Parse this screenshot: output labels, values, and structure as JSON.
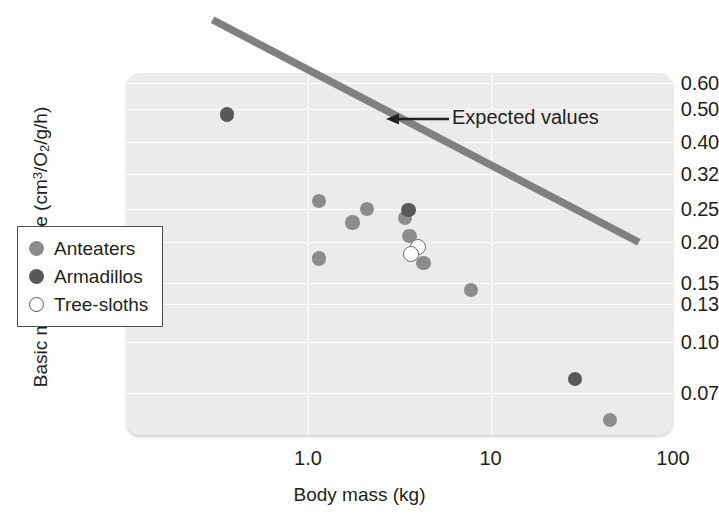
{
  "chart_data": {
    "type": "scatter",
    "title": "",
    "xlabel": "Body mass (kg)",
    "ylabel_text": "Basic metabolic rate (cm3/O2/g/h)",
    "ylabel_parts": {
      "pre": "Basic metabolic rate (cm",
      "sup": "3",
      "mid": "/O",
      "sub": "2",
      "post": "/g/h)"
    },
    "xscale": "log",
    "yscale": "log",
    "xlim": [
      0.3,
      100
    ],
    "ylim": [
      0.055,
      0.72
    ],
    "xticks": [
      "1.0",
      "10",
      "100"
    ],
    "xtick_values": [
      1.0,
      10,
      100
    ],
    "yticks": [
      "0.60",
      "0.50",
      "0.40",
      "0.32",
      "0.25",
      "0.20",
      "0.15",
      "0.13",
      "0.10",
      "0.07"
    ],
    "ytick_values": [
      0.6,
      0.5,
      0.4,
      0.32,
      0.25,
      0.2,
      0.15,
      0.13,
      0.1,
      0.07
    ],
    "grid": true,
    "legend_position": "lower left",
    "series": [
      {
        "name": "Anteaters",
        "color": "#8c8c8c",
        "marker": "filled-circle",
        "points": [
          {
            "x": 1.15,
            "y": 0.265
          },
          {
            "x": 1.15,
            "y": 0.178
          },
          {
            "x": 1.75,
            "y": 0.228
          },
          {
            "x": 2.1,
            "y": 0.251
          },
          {
            "x": 3.4,
            "y": 0.235
          },
          {
            "x": 3.6,
            "y": 0.208
          },
          {
            "x": 4.3,
            "y": 0.172
          },
          {
            "x": 7.8,
            "y": 0.143
          },
          {
            "x": 45.0,
            "y": 0.058
          }
        ]
      },
      {
        "name": "Armadillos",
        "color": "#595959",
        "marker": "filled-circle",
        "points": [
          {
            "x": 0.36,
            "y": 0.482
          },
          {
            "x": 3.55,
            "y": 0.249
          },
          {
            "x": 29.0,
            "y": 0.077
          }
        ]
      },
      {
        "name": "Tree-sloths",
        "color": "#ffffff",
        "marker": "open-circle",
        "points": [
          {
            "x": 4.0,
            "y": 0.192
          },
          {
            "x": 3.65,
            "y": 0.183
          }
        ]
      }
    ],
    "trendline": {
      "label": "Expected values",
      "color": "#808080",
      "start": {
        "x": 0.3,
        "y": 0.93
      },
      "end": {
        "x": 65.0,
        "y": 0.199
      }
    },
    "annotations": [
      {
        "text": "Expected values",
        "arrow": "left-arrow"
      }
    ]
  },
  "legend": {
    "items": [
      {
        "label": "Anteaters",
        "key": "anteaters"
      },
      {
        "label": "Armadillos",
        "key": "armadillos"
      },
      {
        "label": "Tree-sloths",
        "key": "treesloths"
      }
    ]
  },
  "axis": {
    "x_title": "Body mass (kg)",
    "y_title_pre": "Basic metabolic rate (cm",
    "y_title_sup": "3",
    "y_title_mid": "/O",
    "y_title_sub": "2",
    "y_title_post": "/g/h)"
  },
  "annotation": {
    "expected_values": "Expected values"
  }
}
